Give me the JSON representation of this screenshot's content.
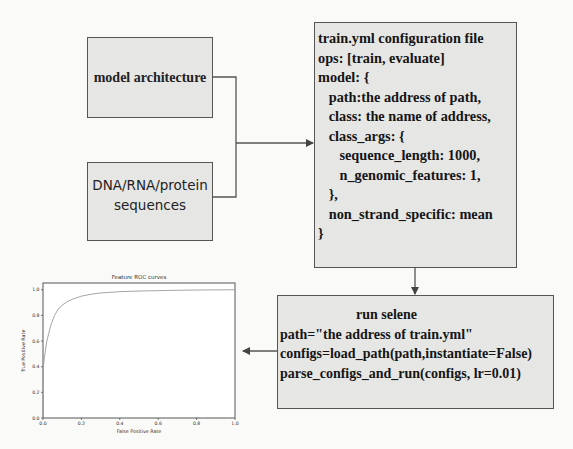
{
  "nodes": {
    "model_architecture": {
      "label": "model architecture"
    },
    "sequences": {
      "lines": [
        "DNA/RNA/protein",
        "sequences"
      ]
    },
    "config": {
      "lines": [
        "train.yml configuration file",
        "ops: [train, evaluate]",
        "model: {",
        "   path:the address of path,",
        "   class: the name of address,",
        "   class_args: {",
        "      sequence_length: 1000,",
        "      n_genomic_features: 1,",
        "   },",
        "   non_strand_specific: mean",
        "}"
      ]
    },
    "run": {
      "title": "run selene",
      "lines": [
        "path=\"the address of train.yml\"",
        "configs=load_path(path,instantiate=False)",
        "parse_configs_and_run(configs, lr=0.01)"
      ]
    }
  },
  "edges": [
    {
      "from": "model_architecture",
      "to": "config"
    },
    {
      "from": "sequences",
      "to": "config"
    },
    {
      "from": "config",
      "to": "run"
    },
    {
      "from": "run",
      "to": "roc_chart"
    }
  ],
  "colors": {
    "box_fill": "#e6e6e4",
    "border": "#555555",
    "curve": "#9a9a9a"
  },
  "chart_data": {
    "type": "line",
    "title": "Feature ROC curves",
    "xlabel": "False Positive Rate",
    "ylabel": "True Positive Rate",
    "xlim": [
      0.0,
      1.0
    ],
    "ylim": [
      0.0,
      1.0
    ],
    "xticks": [
      "0.0",
      "0.2",
      "0.4",
      "0.6",
      "0.8",
      "1.0"
    ],
    "yticks": [
      "0.0",
      "0.2",
      "0.4",
      "0.6",
      "0.8",
      "1.0"
    ],
    "grid": false,
    "series": [
      {
        "name": "ROC",
        "x": [
          0.0,
          0.0,
          0.01,
          0.02,
          0.04,
          0.06,
          0.08,
          0.1,
          0.13,
          0.16,
          0.2,
          0.25,
          0.3,
          0.4,
          0.5,
          0.6,
          0.7,
          0.8,
          0.9,
          1.0
        ],
        "y": [
          0.0,
          0.38,
          0.5,
          0.6,
          0.72,
          0.8,
          0.85,
          0.88,
          0.91,
          0.93,
          0.95,
          0.965,
          0.975,
          0.985,
          0.99,
          0.993,
          0.996,
          0.998,
          0.999,
          1.0
        ]
      }
    ]
  }
}
